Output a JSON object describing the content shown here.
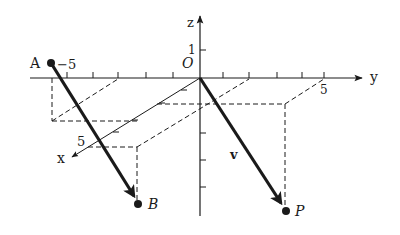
{
  "diagram": {
    "type": "3d-coordinate-vector-translation",
    "axes": {
      "x": {
        "label": "x",
        "tick_label": "5"
      },
      "y": {
        "label": "y",
        "tick_label_neg": "−5",
        "tick_label_pos": "5"
      },
      "z": {
        "label": "z",
        "tick_label": "1"
      }
    },
    "origin_label": "O",
    "points": {
      "A": {
        "label": "A"
      },
      "B": {
        "label": "B"
      },
      "P": {
        "label": "P"
      }
    },
    "vector_label": "v",
    "colors": {
      "ink": "#1a1a1a",
      "background": "#ffffff"
    }
  }
}
